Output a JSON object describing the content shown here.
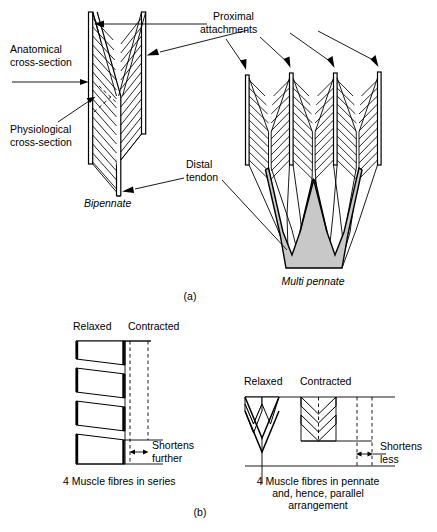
{
  "figure": {
    "background_color": "#ffffff",
    "ink_color": "#000000",
    "shade_color": "#c8c8c8"
  },
  "panel_a": {
    "id_label": "(a)",
    "labels": {
      "anatomical": "Anatomical\ncross-section",
      "anatomical_line1": "Anatomical",
      "anatomical_line2": "cross-section",
      "physiological_line1": "Physiological",
      "physiological_line2": "cross-section",
      "proximal_line1": "Proximal",
      "proximal_line2": "attachments",
      "distal_line1": "Distal",
      "distal_line2": "tendon"
    },
    "bipennate": {
      "caption": "Bipennate",
      "tendon_count": 3,
      "fibre_rows": 17
    },
    "multipennate": {
      "caption": "Multi pennate",
      "proximal_tendon_count": 4,
      "belly_count": 3,
      "shaded": true
    }
  },
  "panel_b": {
    "id_label": "(b)",
    "left": {
      "state_relaxed": "Relaxed",
      "state_contracted": "Contracted",
      "annotation_line1": "Shortens",
      "annotation_line2": "further",
      "caption": "4 Muscle fibres in series",
      "fibre_count": 4
    },
    "right": {
      "state_relaxed": "Relaxed",
      "state_contracted": "Contracted",
      "annotation_line1": "Shortens",
      "annotation_line2": "less",
      "caption_line1": "4 Muscle fibres in pennate",
      "caption_line2": "and, hence, parallel",
      "caption_line3": "arrangement",
      "fibre_count": 4
    }
  }
}
